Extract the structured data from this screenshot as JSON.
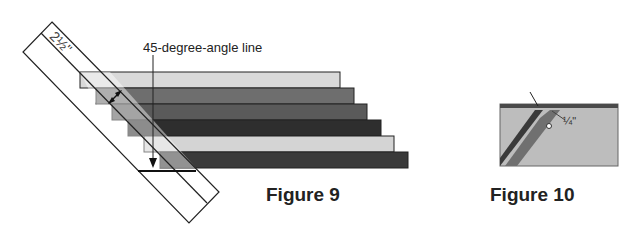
{
  "figures": [
    {
      "caption": "Figure 9",
      "annotation": "45-degree-angle line",
      "ruler_measure": "2½\"",
      "strips": [
        {
          "shade": "light",
          "color": "#d9d9d9",
          "right_edge": 340
        },
        {
          "shade": "medium-dark",
          "color": "#6e6e6e",
          "right_edge": 354
        },
        {
          "shade": "dark",
          "color": "#5a5a5a",
          "right_edge": 367
        },
        {
          "shade": "darkest",
          "color": "#2e2e2e",
          "right_edge": 381
        },
        {
          "shade": "light",
          "color": "#d4d4d4",
          "right_edge": 394
        },
        {
          "shade": "dark",
          "color": "#3a3a3a",
          "right_edge": 408
        }
      ]
    },
    {
      "caption": "Figure 10",
      "seam_allowance": "¼\""
    }
  ]
}
